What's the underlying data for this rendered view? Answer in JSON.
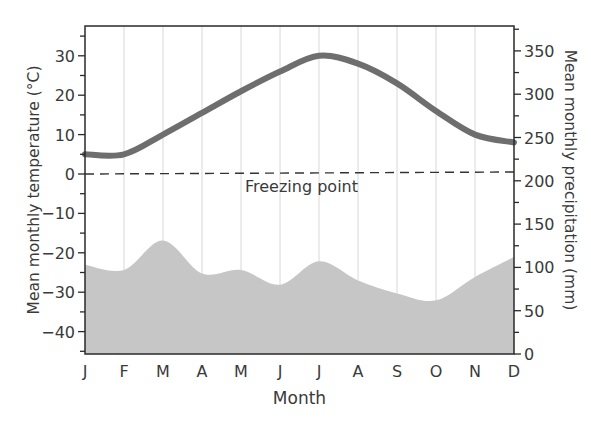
{
  "chart_data": {
    "type": "line+area",
    "title": "",
    "xlabel": "Month",
    "ylabel_left": "Mean monthly temperature (°C)",
    "ylabel_right": "Mean monthly precipitation (mm)",
    "categories": [
      "J",
      "F",
      "M",
      "A",
      "M",
      "J",
      "J",
      "A",
      "S",
      "O",
      "N",
      "D"
    ],
    "series": [
      {
        "name": "Mean monthly temperature",
        "type": "line",
        "axis": "left",
        "color": "#6e6e6e",
        "values": [
          5,
          5,
          10,
          15.5,
          21,
          26,
          30,
          28,
          23,
          16,
          10,
          8
        ]
      },
      {
        "name": "Mean monthly precipitation",
        "type": "area",
        "axis": "right",
        "color": "#c6c6c6",
        "values": [
          103,
          97,
          131,
          93,
          97,
          80,
          107,
          85,
          70,
          62,
          89,
          112
        ]
      }
    ],
    "ylim_left": [
      -45,
      38
    ],
    "yticks_left": [
      30,
      20,
      10,
      0,
      -10,
      -20,
      -30,
      -40
    ],
    "ylim_right": [
      0,
      380
    ],
    "yticks_right": [
      350,
      300,
      250,
      200,
      150,
      100,
      50,
      0
    ],
    "annotations": [
      {
        "text": "Freezing point",
        "y_left": 0,
        "style": "dashed-line"
      }
    ],
    "grid": {
      "vertical": true,
      "horizontal": false
    },
    "legend": "none"
  },
  "labels": {
    "xlabel": "Month",
    "ylabel_left": "Mean monthly temperature (°C)",
    "ylabel_right": "Mean monthly precipitation (mm)",
    "freezing": "Freezing point"
  }
}
